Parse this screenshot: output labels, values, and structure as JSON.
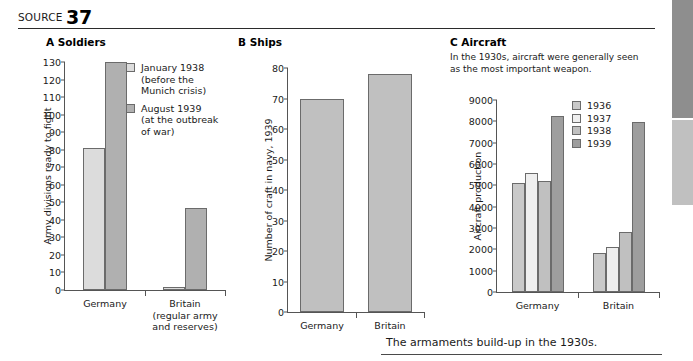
{
  "header": {
    "source_word": "SOURCE",
    "source_number": "37"
  },
  "caption": "The armaments build-up in the 1930s.",
  "colors": {
    "bar_light": "#dcdcdc",
    "bar_lighter": "#efefef",
    "bar_medium": "#c9c9c9",
    "bar_dark": "#b0b0b0",
    "bar_darkest": "#9e9e9e",
    "axis": "#555555",
    "edge_tab_dark": "#8e8e8e",
    "edge_tab_light": "#c0c0c0"
  },
  "panel_a": {
    "title": "A Soldiers",
    "legend": [
      {
        "label": "January 1938\n(before the\nMunich crisis)",
        "color": "#dcdcdc"
      },
      {
        "label": "August 1939\n(at the outbreak\nof war)",
        "color": "#b0b0b0"
      }
    ],
    "xlabels": [
      "Germany",
      "Britain\n(regular army\nand reserves)"
    ]
  },
  "panel_b": {
    "title": "B Ships"
  },
  "panel_c": {
    "title": "C Aircraft",
    "intro": "In the 1930s, aircraft were generally seen as the most important weapon.",
    "legend": [
      {
        "label": "1936",
        "color": "#c9c9c9"
      },
      {
        "label": "1937",
        "color": "#efefef"
      },
      {
        "label": "1938",
        "color": "#c0c0c0"
      },
      {
        "label": "1939",
        "color": "#9e9e9e"
      }
    ]
  },
  "chart_data": [
    {
      "id": "chart-a",
      "type": "bar",
      "title": "A Soldiers",
      "xlabel": "",
      "ylabel": "Army divisions ready to fight",
      "ylim": [
        0,
        130
      ],
      "ytick_step": 10,
      "yticks": [
        0,
        10,
        20,
        30,
        40,
        50,
        60,
        70,
        80,
        90,
        100,
        110,
        120,
        130
      ],
      "grid": false,
      "legend_position": "inside-top-right",
      "categories": [
        "Germany",
        "Britain (regular army and reserves)"
      ],
      "series": [
        {
          "name": "January 1938 (before the Munich crisis)",
          "color": "#dcdcdc",
          "values": [
            81,
            2
          ]
        },
        {
          "name": "August 1939 (at the outbreak of war)",
          "color": "#b0b0b0",
          "values": [
            130,
            47
          ]
        }
      ]
    },
    {
      "id": "chart-b",
      "type": "bar",
      "title": "B Ships",
      "xlabel": "",
      "ylabel": "Number of craft in navy, 1939",
      "ylim": [
        0,
        80
      ],
      "ytick_step": 10,
      "yticks": [
        0,
        10,
        20,
        30,
        40,
        50,
        60,
        70,
        80
      ],
      "grid": false,
      "legend_position": "none",
      "categories": [
        "Germany",
        "Britain"
      ],
      "series": [
        {
          "name": "Number of craft in navy, 1939",
          "color": "#c0c0c0",
          "values": [
            70,
            78
          ]
        }
      ]
    },
    {
      "id": "chart-c",
      "type": "bar",
      "title": "C Aircraft",
      "subtitle": "In the 1930s, aircraft were generally seen as the most important weapon.",
      "xlabel": "",
      "ylabel": "Aircraft production",
      "ylim": [
        0,
        9000
      ],
      "ytick_step": 1000,
      "yticks": [
        0,
        1000,
        2000,
        3000,
        4000,
        5000,
        6000,
        7000,
        8000,
        9000
      ],
      "grid": false,
      "legend_position": "inside-top-right",
      "categories": [
        "Germany",
        "Britain"
      ],
      "series": [
        {
          "name": "1936",
          "color": "#c9c9c9",
          "values": [
            5100,
            1850
          ]
        },
        {
          "name": "1937",
          "color": "#efefef",
          "values": [
            5600,
            2100
          ]
        },
        {
          "name": "1938",
          "color": "#c0c0c0",
          "values": [
            5200,
            2800
          ]
        },
        {
          "name": "1939",
          "color": "#9e9e9e",
          "values": [
            8250,
            7950
          ]
        }
      ]
    }
  ]
}
